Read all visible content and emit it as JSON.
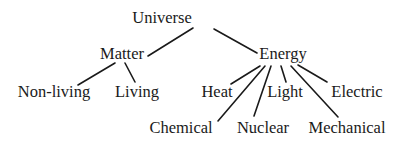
{
  "diagram": {
    "type": "tree",
    "root": "Universe",
    "nodes": [
      {
        "id": "universe",
        "label": "Universe",
        "x": 162,
        "y": 10
      },
      {
        "id": "matter",
        "label": "Matter",
        "x": 122,
        "y": 46
      },
      {
        "id": "energy",
        "label": "Energy",
        "x": 283,
        "y": 46
      },
      {
        "id": "non-living",
        "label": "Non-living",
        "x": 54,
        "y": 84
      },
      {
        "id": "living",
        "label": "Living",
        "x": 137,
        "y": 84
      },
      {
        "id": "heat",
        "label": "Heat",
        "x": 217,
        "y": 84
      },
      {
        "id": "light",
        "label": "Light",
        "x": 285,
        "y": 84
      },
      {
        "id": "electric",
        "label": "Electric",
        "x": 357,
        "y": 84
      },
      {
        "id": "chemical",
        "label": "Chemical",
        "x": 181,
        "y": 120
      },
      {
        "id": "nuclear",
        "label": "Nuclear",
        "x": 263,
        "y": 120
      },
      {
        "id": "mechanical",
        "label": "Mechanical",
        "x": 347,
        "y": 120
      }
    ],
    "edges": [
      {
        "from": "universe",
        "to": "matter",
        "x1": 193,
        "y1": 28,
        "x2": 148,
        "y2": 56
      },
      {
        "from": "universe",
        "to": "energy",
        "x1": 214,
        "y1": 29,
        "x2": 257,
        "y2": 53
      },
      {
        "from": "matter",
        "to": "non-living",
        "x1": 115,
        "y1": 63,
        "x2": 78,
        "y2": 85
      },
      {
        "from": "matter",
        "to": "living",
        "x1": 125,
        "y1": 63,
        "x2": 135,
        "y2": 82
      },
      {
        "from": "energy",
        "to": "heat",
        "x1": 260,
        "y1": 66,
        "x2": 231,
        "y2": 84
      },
      {
        "from": "energy",
        "to": "chemical",
        "x1": 265,
        "y1": 66,
        "x2": 218,
        "y2": 121
      },
      {
        "from": "energy",
        "to": "nuclear",
        "x1": 271,
        "y1": 66,
        "x2": 254,
        "y2": 116
      },
      {
        "from": "energy",
        "to": "light",
        "x1": 281,
        "y1": 66,
        "x2": 286,
        "y2": 82
      },
      {
        "from": "energy",
        "to": "mechanical",
        "x1": 291,
        "y1": 66,
        "x2": 338,
        "y2": 117
      },
      {
        "from": "energy",
        "to": "electric",
        "x1": 298,
        "y1": 65,
        "x2": 327,
        "y2": 82
      }
    ]
  },
  "labels": {
    "universe": "Universe",
    "matter": "Matter",
    "energy": "Energy",
    "non_living": "Non-living",
    "living": "Living",
    "heat": "Heat",
    "light": "Light",
    "electric": "Electric",
    "chemical": "Chemical",
    "nuclear": "Nuclear",
    "mechanical": "Mechanical"
  },
  "colors": {
    "text": "#1a1a1a",
    "line": "#1a1a1a",
    "background": "#ffffff"
  }
}
